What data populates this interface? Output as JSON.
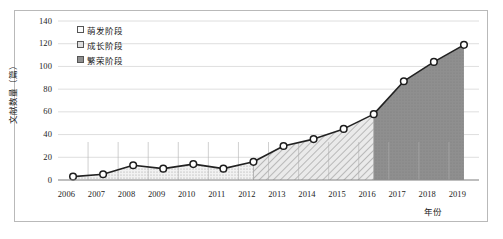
{
  "chart_data": {
    "type": "area",
    "title": "",
    "xlabel": "年份",
    "ylabel": "文献数量（篇）",
    "categories": [
      "2006",
      "2007",
      "2008",
      "2009",
      "2010",
      "2011",
      "2012",
      "2013",
      "2014",
      "2015",
      "2016",
      "2017",
      "2018",
      "2019"
    ],
    "values": [
      3,
      5,
      13,
      10,
      14,
      10,
      16,
      30,
      36,
      45,
      58,
      87,
      104,
      119
    ],
    "series": [
      {
        "name": "文献数量",
        "values": [
          3,
          5,
          13,
          10,
          14,
          10,
          16,
          30,
          36,
          45,
          58,
          87,
          104,
          119
        ]
      }
    ],
    "ylim": [
      0,
      140
    ],
    "ytick_labels": [
      "0",
      "20",
      "40",
      "60",
      "80",
      "100",
      "120",
      "140"
    ],
    "ytick_values": [
      0,
      20,
      40,
      60,
      80,
      100,
      120,
      140
    ],
    "grid": true,
    "legend_position": "top-left",
    "marker": "open-circle",
    "stages": [
      {
        "label": "萌发阶段",
        "fill": "dotted-light",
        "start_index": 0,
        "end_index": 6,
        "color": "#e8e8e8"
      },
      {
        "label": "成长阶段",
        "fill": "diagonal-hatch",
        "start_index": 6,
        "end_index": 10,
        "color": "#d4d4d4"
      },
      {
        "label": "繁荣阶段",
        "fill": "solid-gray",
        "start_index": 10,
        "end_index": 13,
        "color": "#8c8c8c"
      }
    ]
  },
  "legend": {
    "items": [
      {
        "label": "萌发阶段",
        "swatch": "legend-swatch-germination"
      },
      {
        "label": "成长阶段",
        "swatch": "legend-swatch-growth"
      },
      {
        "label": "繁荣阶段",
        "swatch": "legend-swatch-prosperity"
      }
    ]
  },
  "axes": {
    "y_title": "文献数量（篇）",
    "x_title": "年份"
  }
}
